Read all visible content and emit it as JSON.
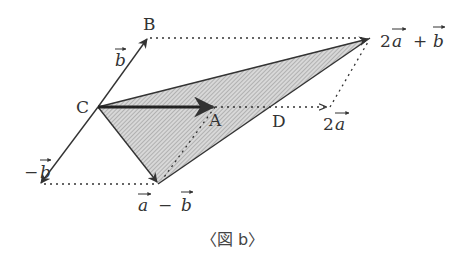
{
  "diagram": {
    "points": {
      "C": {
        "label": "C",
        "x": 98,
        "y": 107
      },
      "A": {
        "label": "A",
        "x": 215,
        "y": 107
      },
      "B": {
        "label": "B",
        "x": 148,
        "y": 38
      },
      "D": {
        "label": "D",
        "x": 281,
        "y": 107
      },
      "two_a": {
        "label": "2a",
        "x": 330,
        "y": 107
      },
      "two_a_plus_b": {
        "label": "2a + b",
        "x": 370,
        "y": 38
      },
      "a_minus_b": {
        "label": "a − b",
        "x": 158,
        "y": 184
      },
      "minus_b": {
        "label": "−b",
        "x": 40,
        "y": 184
      }
    },
    "labels": {
      "C": "C",
      "A": "A",
      "B": "B",
      "D": "D",
      "b_vec": "b",
      "minus": "−",
      "minus_b_vec": "b",
      "two": "2",
      "a_vec": "a",
      "plus": "+",
      "b_vec2": "b",
      "a_vec2": "a",
      "a_vec3": "a",
      "b_vec3": "b",
      "minus2": "−"
    },
    "shaded_triangle": [
      "C",
      "two_a_plus_b",
      "a_minus_b"
    ],
    "hatch_color": "#b0b0b0",
    "line_color": "#333333",
    "caption": "〈図 b〉"
  }
}
